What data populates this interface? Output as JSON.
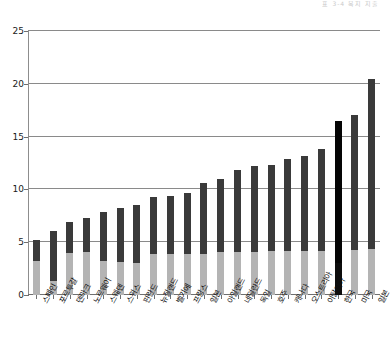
{
  "header": {
    "faint_text": "표 3-4  복지 지출"
  },
  "chart_data": {
    "type": "bar",
    "stacked": true,
    "title": "",
    "xlabel": "",
    "ylabel": "",
    "ylim": [
      0,
      25
    ],
    "yticks": [
      0,
      5,
      10,
      15,
      20,
      25
    ],
    "grid": true,
    "legend_position": "none",
    "highlight_category": "한국",
    "categories": [
      "스페인",
      "포르투갈",
      "덴마크",
      "노르웨이",
      "스웨덴",
      "스위스",
      "핀란드",
      "뉴질랜드",
      "벨기에",
      "프랑스",
      "일본",
      "아일랜드",
      "네덜란드",
      "독일",
      "호주",
      "캐나다",
      "오스트리아",
      "이탈리아",
      "한국",
      "미국",
      "일본"
    ],
    "series": [
      {
        "name": "하위 부문",
        "color": "#b4b4b4",
        "values": [
          3.2,
          1.3,
          4.0,
          4.1,
          3.2,
          3.1,
          3.0,
          3.9,
          3.9,
          3.9,
          3.9,
          4.1,
          4.1,
          4.1,
          4.2,
          4.2,
          4.2,
          4.2,
          3.0,
          4.3,
          4.4
        ]
      },
      {
        "name": "상위 부문",
        "color": "#3a3a3a",
        "values": [
          2.0,
          4.8,
          2.9,
          3.2,
          4.7,
          5.1,
          5.5,
          5.4,
          5.5,
          5.8,
          6.7,
          6.9,
          7.7,
          8.1,
          8.1,
          8.7,
          9.0,
          9.6,
          13.5,
          12.7,
          16.1
        ]
      }
    ],
    "totals": [
      5.2,
      6.1,
      6.9,
      7.3,
      7.9,
      8.2,
      8.5,
      9.3,
      9.4,
      9.7,
      10.6,
      11.0,
      11.8,
      12.2,
      12.3,
      12.9,
      13.2,
      13.8,
      16.5,
      17.0,
      20.5
    ]
  }
}
